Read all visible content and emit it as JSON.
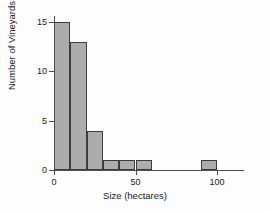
{
  "chart_data": {
    "type": "bar",
    "title": "",
    "subtitle": "",
    "xlabel": "Size (hectares)",
    "ylabel": "Number of Vineyards",
    "xlim": [
      0,
      115
    ],
    "ylim": [
      0,
      15
    ],
    "xticks": [
      0,
      50,
      100
    ],
    "xtick_labels": [
      "0",
      "50",
      "100"
    ],
    "yticks": [
      0,
      5,
      10,
      15
    ],
    "ytick_labels": [
      "0",
      "5",
      "10",
      "15"
    ],
    "grid": false,
    "legend": null,
    "bin_width": 10,
    "bar_color": "#acacac",
    "bar_edge_color": "#3d3d3d",
    "axis_color": "#4d4d4d",
    "background_color": "#fdfdfd",
    "bins": [
      {
        "label": "0-10",
        "x0": 0,
        "x1": 10,
        "value": 15
      },
      {
        "label": "10-20",
        "x0": 10,
        "x1": 20,
        "value": 13
      },
      {
        "label": "20-30",
        "x0": 20,
        "x1": 30,
        "value": 4
      },
      {
        "label": "30-40",
        "x0": 30,
        "x1": 40,
        "value": 1
      },
      {
        "label": "40-50",
        "x0": 40,
        "x1": 50,
        "value": 1
      },
      {
        "label": "50-60",
        "x0": 50,
        "x1": 60,
        "value": 1
      },
      {
        "label": "60-70",
        "x0": 60,
        "x1": 70,
        "value": 0
      },
      {
        "label": "70-80",
        "x0": 70,
        "x1": 80,
        "value": 0
      },
      {
        "label": "80-90",
        "x0": 80,
        "x1": 90,
        "value": 0
      },
      {
        "label": "90-100",
        "x0": 90,
        "x1": 100,
        "value": 1
      },
      {
        "label": "100-110",
        "x0": 100,
        "x1": 110,
        "value": 0
      }
    ],
    "categories": [
      "0-10",
      "10-20",
      "20-30",
      "30-40",
      "40-50",
      "50-60",
      "60-70",
      "70-80",
      "80-90",
      "90-100",
      "100-110"
    ],
    "values": [
      15,
      13,
      4,
      1,
      1,
      1,
      0,
      0,
      0,
      1,
      0
    ]
  }
}
